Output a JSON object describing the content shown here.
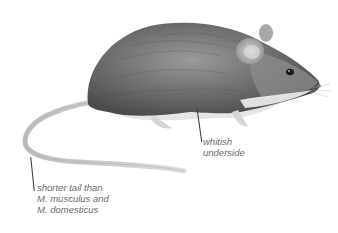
{
  "illustration": {
    "subject": "mouse",
    "colors": {
      "fur_dark": "#5a5a5a",
      "fur_mid": "#8a8a8a",
      "underside": "#e8e8e8",
      "tail": "#c8c8c8",
      "label_text": "#6a6a6a",
      "leader_line": "#333333"
    }
  },
  "annotations": [
    {
      "id": "underside",
      "lines": [
        "whitish",
        "underside"
      ]
    },
    {
      "id": "tail",
      "lines": [
        "shorter tail than",
        "M. musculus and",
        "M. domesticus"
      ]
    }
  ]
}
